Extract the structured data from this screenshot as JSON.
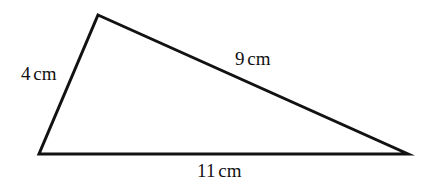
{
  "figure": {
    "kind": "geometry-diagram",
    "shape": "triangle",
    "background_color": "#ffffff",
    "stroke_color": "#121212",
    "stroke_width": 3,
    "width": 434,
    "height": 184,
    "vertices": {
      "apex": {
        "x": 98,
        "y": 15
      },
      "bottom_left": {
        "x": 39,
        "y": 154
      },
      "bottom_right": {
        "x": 408,
        "y": 154
      }
    },
    "labels": {
      "left_side": {
        "value": "4",
        "unit": "cm",
        "text": "4 cm"
      },
      "slanted_side": {
        "value": "9",
        "unit": "cm",
        "text": "9 cm"
      },
      "base_side": {
        "value": "11",
        "unit": "cm",
        "text": "11 cm"
      }
    }
  }
}
